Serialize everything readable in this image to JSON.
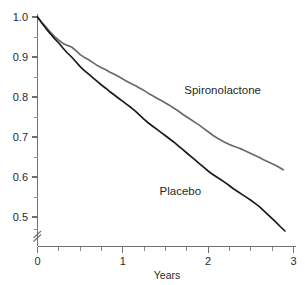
{
  "chart_data": {
    "type": "line",
    "title": "",
    "subtitle": "",
    "xlabel": "Years",
    "ylabel": "",
    "xlim": [
      0,
      3
    ],
    "ylim": [
      0.44,
      1.0
    ],
    "grid": false,
    "legend_position": "inline-annotation",
    "y_axis_break": true,
    "y_axis_break_symbol": "//",
    "xticks": [
      0,
      1,
      2,
      3
    ],
    "xtick_labels": [
      "0",
      "1",
      "2",
      "3"
    ],
    "xticks_minor": [
      0.25,
      0.5,
      0.75,
      1.25,
      1.5,
      1.75,
      2.25,
      2.5,
      2.75
    ],
    "yticks": [
      0.5,
      0.6,
      0.7,
      0.8,
      0.9,
      1.0
    ],
    "ytick_labels": [
      "0.5",
      "0.6",
      "0.7",
      "0.8",
      "0.9",
      "1.0"
    ],
    "yticks_minor": [
      0.55,
      0.65,
      0.75,
      0.85,
      0.95
    ],
    "series": [
      {
        "name": "Spironolactone",
        "color": "#6a6a6a",
        "label_x": 1.72,
        "label_y": 0.807,
        "x": [
          0.0,
          0.05,
          0.1,
          0.15,
          0.2,
          0.25,
          0.3,
          0.35,
          0.4,
          0.45,
          0.5,
          0.55,
          0.6,
          0.65,
          0.7,
          0.75,
          0.8,
          0.85,
          0.9,
          0.95,
          1.0,
          1.05,
          1.1,
          1.15,
          1.2,
          1.25,
          1.3,
          1.35,
          1.4,
          1.45,
          1.5,
          1.55,
          1.6,
          1.65,
          1.7,
          1.75,
          1.8,
          1.85,
          1.9,
          1.95,
          2.0,
          2.05,
          2.1,
          2.15,
          2.2,
          2.25,
          2.3,
          2.35,
          2.4,
          2.45,
          2.5,
          2.55,
          2.6,
          2.65,
          2.7,
          2.75,
          2.8,
          2.85,
          2.88
        ],
        "y": [
          1.0,
          0.987,
          0.975,
          0.962,
          0.951,
          0.942,
          0.934,
          0.929,
          0.925,
          0.916,
          0.906,
          0.899,
          0.893,
          0.886,
          0.879,
          0.873,
          0.868,
          0.862,
          0.857,
          0.851,
          0.845,
          0.839,
          0.833,
          0.828,
          0.822,
          0.816,
          0.809,
          0.803,
          0.797,
          0.791,
          0.785,
          0.779,
          0.772,
          0.765,
          0.757,
          0.75,
          0.743,
          0.736,
          0.729,
          0.721,
          0.713,
          0.705,
          0.698,
          0.692,
          0.686,
          0.681,
          0.677,
          0.673,
          0.669,
          0.664,
          0.659,
          0.654,
          0.649,
          0.643,
          0.638,
          0.633,
          0.628,
          0.622,
          0.618
        ]
      },
      {
        "name": "Placebo",
        "color": "#1a1a1a",
        "label_x": 1.43,
        "label_y": 0.555,
        "x": [
          0.0,
          0.05,
          0.1,
          0.15,
          0.2,
          0.25,
          0.3,
          0.35,
          0.4,
          0.45,
          0.5,
          0.55,
          0.6,
          0.65,
          0.7,
          0.75,
          0.8,
          0.85,
          0.9,
          0.95,
          1.0,
          1.05,
          1.1,
          1.15,
          1.2,
          1.25,
          1.3,
          1.35,
          1.4,
          1.45,
          1.5,
          1.55,
          1.6,
          1.65,
          1.7,
          1.75,
          1.8,
          1.85,
          1.9,
          1.95,
          2.0,
          2.05,
          2.1,
          2.15,
          2.2,
          2.25,
          2.3,
          2.35,
          2.4,
          2.45,
          2.5,
          2.55,
          2.6,
          2.65,
          2.7,
          2.75,
          2.8,
          2.85,
          2.9
        ],
        "y": [
          1.0,
          0.985,
          0.971,
          0.958,
          0.946,
          0.935,
          0.922,
          0.91,
          0.9,
          0.888,
          0.876,
          0.866,
          0.857,
          0.848,
          0.839,
          0.83,
          0.822,
          0.813,
          0.805,
          0.797,
          0.789,
          0.781,
          0.773,
          0.764,
          0.754,
          0.744,
          0.735,
          0.727,
          0.719,
          0.711,
          0.703,
          0.695,
          0.687,
          0.678,
          0.669,
          0.66,
          0.651,
          0.642,
          0.633,
          0.624,
          0.615,
          0.607,
          0.6,
          0.593,
          0.586,
          0.578,
          0.57,
          0.563,
          0.556,
          0.549,
          0.542,
          0.534,
          0.526,
          0.516,
          0.506,
          0.496,
          0.486,
          0.475,
          0.465
        ]
      }
    ]
  },
  "labels": {
    "xlabel": "Years",
    "series_spironolactone": "Spironolactone",
    "series_placebo": "Placebo",
    "ytick_1_0": "1.0",
    "ytick_0_9": "0.9",
    "ytick_0_8": "0.8",
    "ytick_0_7": "0.7",
    "ytick_0_6": "0.6",
    "ytick_0_5": "0.5",
    "xtick_0": "0",
    "xtick_1": "1",
    "xtick_2": "2",
    "xtick_3": "3"
  }
}
